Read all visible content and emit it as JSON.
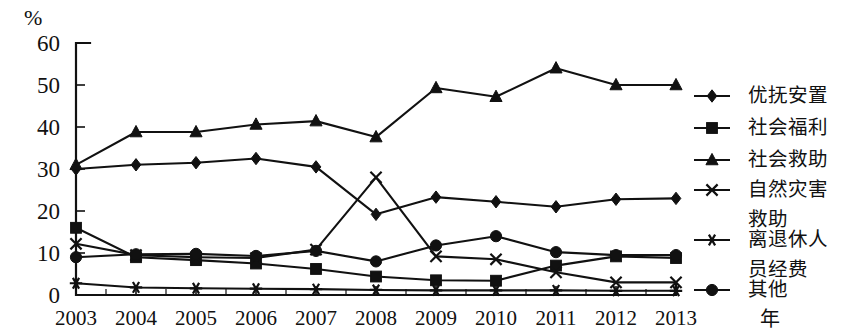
{
  "chart_data": {
    "type": "line",
    "title": "",
    "xlabel": "年",
    "ylabel": "%",
    "ylim": [
      0,
      60
    ],
    "yticks": [
      0,
      10,
      20,
      30,
      40,
      50,
      60
    ],
    "grid": false,
    "legend_position": "right",
    "categories": [
      "2003",
      "2004",
      "2005",
      "2006",
      "2007",
      "2008",
      "2009",
      "2010",
      "2011",
      "2012",
      "2013"
    ],
    "series": [
      {
        "name": "优抚安置",
        "marker": "diamond",
        "values": [
          30.0,
          31.0,
          31.5,
          32.5,
          30.5,
          19.2,
          23.3,
          22.2,
          21.0,
          22.8,
          23.0
        ]
      },
      {
        "name": "社会福利",
        "marker": "square",
        "values": [
          16.0,
          9.0,
          8.3,
          7.5,
          6.2,
          4.4,
          3.5,
          3.4,
          7.0,
          9.2,
          8.8
        ]
      },
      {
        "name": "社会救助",
        "marker": "triangle",
        "values": [
          31.0,
          38.8,
          38.8,
          40.6,
          41.4,
          37.6,
          49.3,
          47.2,
          54.0,
          50.0,
          50.0
        ]
      },
      {
        "name": "自然灾害救助",
        "marker": "cross",
        "values": [
          12.2,
          9.5,
          9.0,
          8.8,
          10.8,
          28.0,
          9.2,
          8.5,
          5.4,
          3.0,
          3.0
        ]
      },
      {
        "name": "离退休人员经费",
        "marker": "asterisk",
        "values": [
          2.8,
          1.8,
          1.6,
          1.5,
          1.4,
          1.2,
          1.1,
          1.1,
          1.1,
          1.0,
          1.0
        ]
      },
      {
        "name": "其他",
        "marker": "circle",
        "values": [
          9.0,
          9.7,
          9.8,
          9.3,
          10.5,
          8.0,
          11.8,
          14.0,
          10.2,
          9.5,
          9.5
        ]
      }
    ]
  },
  "axes": {
    "y_unit_label": "%",
    "x_unit_label": "年"
  },
  "legend": {
    "items": [
      {
        "label": "优抚安置",
        "marker": "diamond"
      },
      {
        "label": "社会福利",
        "marker": "square"
      },
      {
        "label": "社会救助",
        "marker": "triangle"
      },
      {
        "label": "自然灾害救助",
        "marker": "cross",
        "line2": "救助",
        "line1": "自然灾害"
      },
      {
        "label": "离退休人员经费",
        "marker": "asterisk",
        "line1": "离退休人",
        "line2": "员经费"
      },
      {
        "label": "其他",
        "marker": "circle"
      }
    ]
  }
}
